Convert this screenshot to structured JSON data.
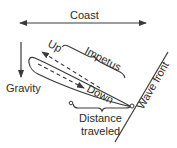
{
  "diagram": {
    "labels": {
      "coast": "Coast",
      "gravity": "Gravity",
      "up": "Up",
      "impetus": "Impetus",
      "down": "Down",
      "distance_line1": "Distance",
      "distance_line2": "traveled",
      "wave_front": "Wave front"
    },
    "colors": {
      "stroke": "#3a3a3a",
      "text": "#2a2a2a",
      "background": "#ffffff"
    }
  }
}
